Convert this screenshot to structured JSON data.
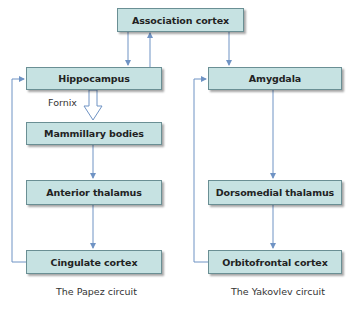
{
  "nodes": {
    "association_cortex": "Association cortex",
    "hippocampus": "Hippocampus",
    "mammillary_bodies": "Mammillary bodies",
    "anterior_thalamus": "Anterior thalamus",
    "cingulate_cortex": "Cingulate cortex",
    "amygdala": "Amygdala",
    "dorsomedial_thalamus": "Dorsomedial thalamus",
    "orbitofrontal_cortex": "Orbitofrontal cortex"
  },
  "edge_labels": {
    "fornix": "Fornix"
  },
  "captions": {
    "left": "The Papez circuit",
    "right": "The Yakovlev circuit"
  },
  "colors": {
    "box_fill": "#c6e2e2",
    "box_border": "#6a8f94",
    "arrow": "#6f93c4"
  }
}
